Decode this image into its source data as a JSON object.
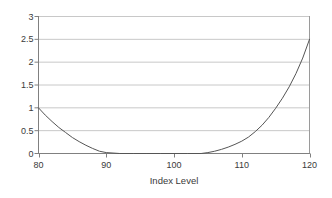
{
  "chart_data": {
    "type": "line",
    "title": "",
    "subtitle": "",
    "xlabel": "Index Level",
    "ylabel": "",
    "xlim": [
      80,
      120
    ],
    "ylim": [
      0,
      3
    ],
    "grid": true,
    "legend": false,
    "legend_position": "none",
    "xticks": [
      80,
      90,
      100,
      110,
      120
    ],
    "xtick_labels": [
      "80",
      "90",
      "100",
      "110",
      "120"
    ],
    "yticks": [
      0,
      0.5,
      1,
      1.5,
      2,
      2.5,
      3
    ],
    "ytick_labels": [
      "0",
      "0.5",
      "1",
      "1.5",
      "2",
      "2.5",
      "3"
    ],
    "series": [
      {
        "name": "payoff",
        "color": "#555555",
        "x": [
          80,
          81,
          82,
          83,
          84,
          85,
          86,
          87,
          88,
          89,
          90,
          92,
          94,
          96,
          98,
          100,
          102,
          104,
          105,
          106,
          107,
          108,
          109,
          110,
          111,
          112,
          113,
          114,
          115,
          116,
          117,
          118,
          119,
          120
        ],
        "values": [
          1.0,
          0.84,
          0.7,
          0.57,
          0.46,
          0.35,
          0.26,
          0.18,
          0.11,
          0.05,
          0.02,
          0.0,
          0.0,
          0.0,
          0.0,
          0.0,
          0.0,
          0.0,
          0.02,
          0.05,
          0.09,
          0.14,
          0.2,
          0.27,
          0.36,
          0.48,
          0.62,
          0.79,
          0.99,
          1.21,
          1.46,
          1.75,
          2.09,
          2.5
        ]
      }
    ],
    "annotations": []
  },
  "axis": {
    "xaxis_title": "Index Level"
  },
  "style": {
    "grid_color": "#c8c8c8",
    "axis_color": "#808080",
    "curve_color": "#555555",
    "text_color": "#3a3a3a",
    "background": "#ffffff"
  }
}
